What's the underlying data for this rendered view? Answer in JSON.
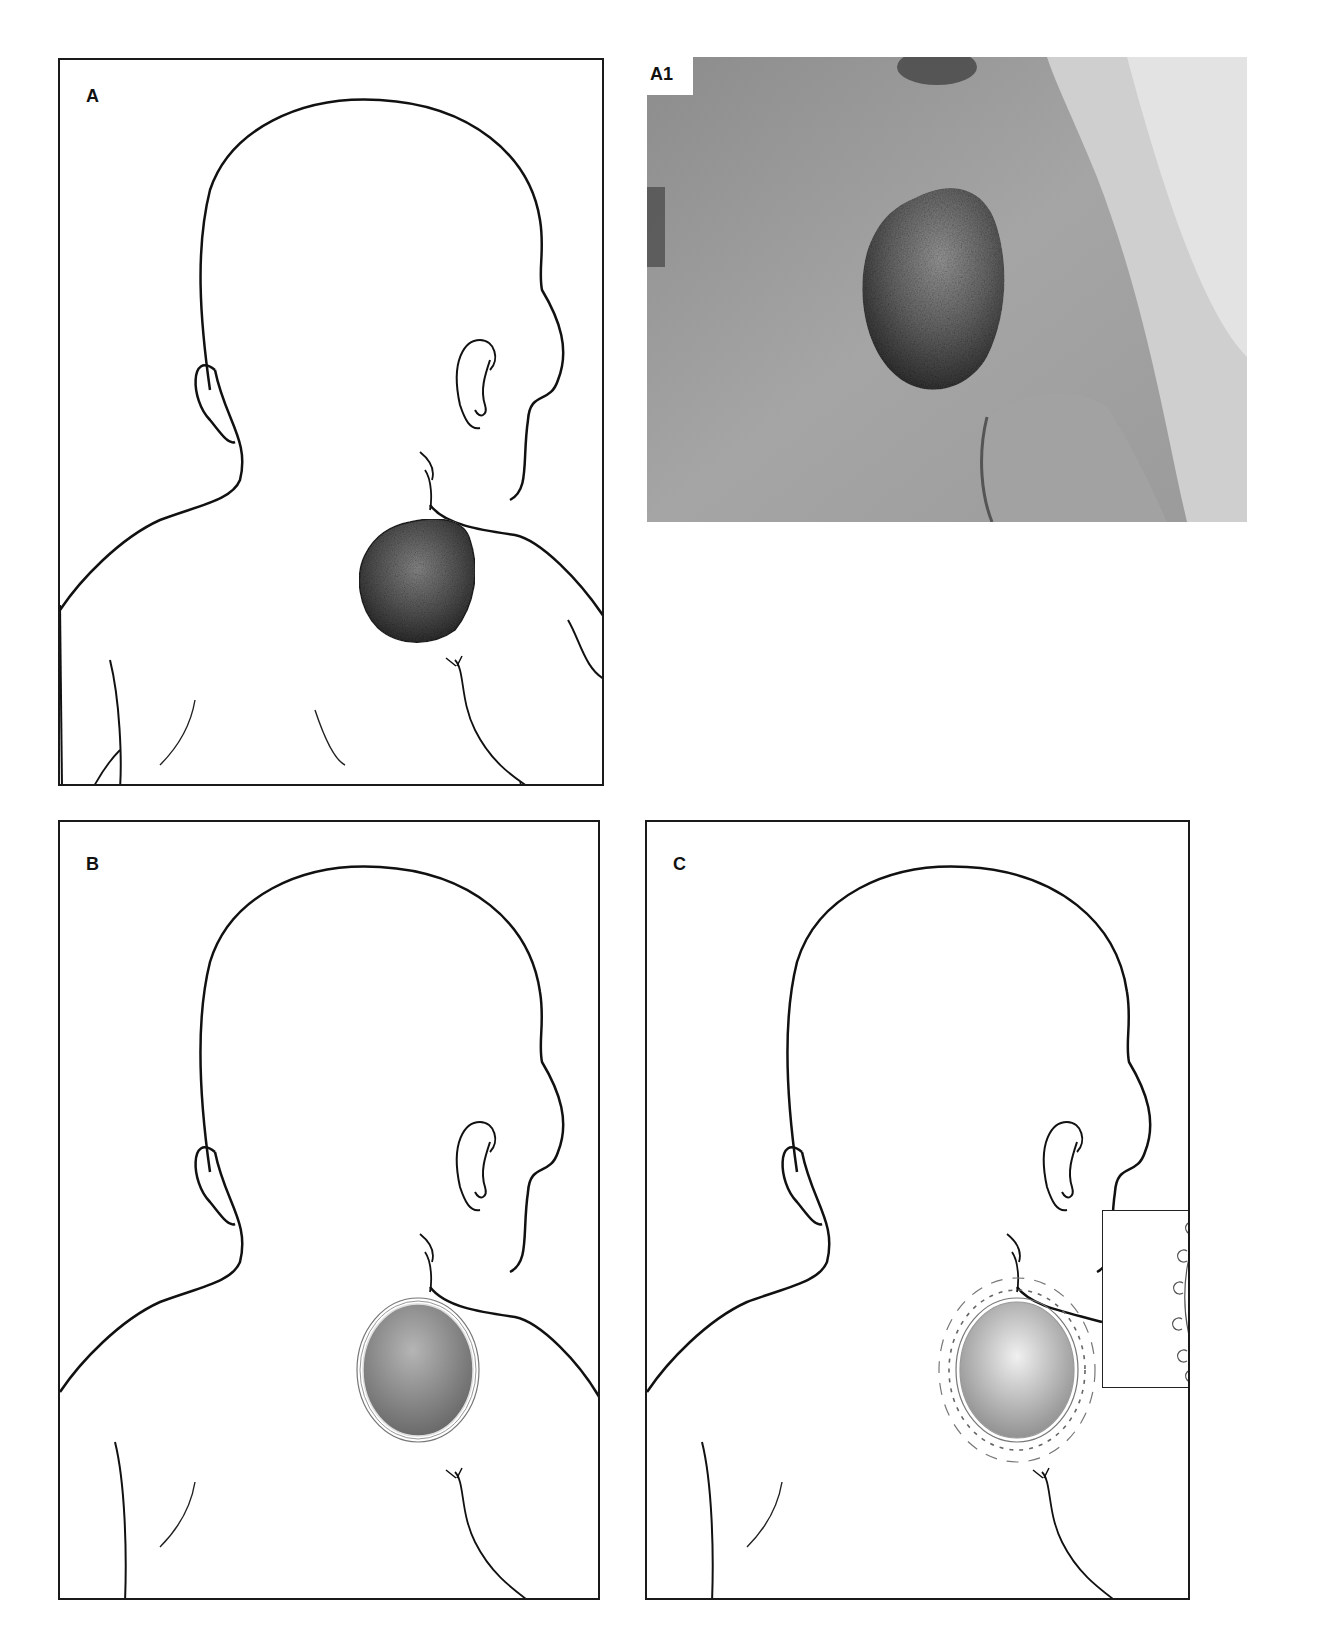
{
  "figure": {
    "panels": [
      {
        "id": "A",
        "label": "A",
        "type": "line-drawing",
        "description": "Infant back view with large verrucous pigmented lesion on upper back/shoulder"
      },
      {
        "id": "A1",
        "label": "A1",
        "type": "clinical-photograph",
        "description": "Photograph of infant back with large verrucous lesion"
      },
      {
        "id": "B",
        "label": "B",
        "type": "line-drawing",
        "description": "Lesion excised to oval wound with graft outline"
      },
      {
        "id": "C",
        "label": "C",
        "type": "line-drawing",
        "description": "Graft secured with circumferential sutures and dashed outer boundary, with magnified inset"
      }
    ],
    "inset": {
      "label": "",
      "description": "Magnified detail of graft edge with sutures"
    }
  },
  "colors": {
    "line": "#111111",
    "lesion_dark": "#3a3a3a",
    "lesion_mid": "#6a6a6a",
    "graft_mid": "#8a8a8a",
    "photo_skin": "#9a9a9a"
  }
}
